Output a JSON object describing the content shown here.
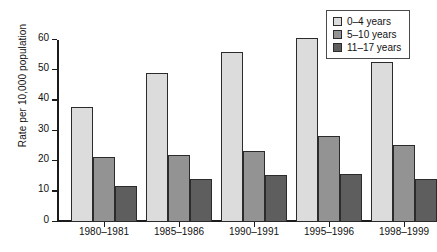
{
  "chart_data": {
    "type": "bar",
    "title": "",
    "xlabel": "",
    "ylabel": "Rate per 10,000 population",
    "categories": [
      "1980–1981",
      "1985–1986",
      "1990–1991",
      "1995–1996",
      "1998–1999"
    ],
    "series": [
      {
        "name": "0–4 years",
        "color": "#dcdcdc",
        "values": [
          37.8,
          49.0,
          56.0,
          60.5,
          52.6
        ]
      },
      {
        "name": "5–10 years",
        "color": "#939393",
        "values": [
          21.3,
          22.1,
          23.5,
          28.3,
          25.3
        ]
      },
      {
        "name": "11–17 years",
        "color": "#5e5e5e",
        "values": [
          12.0,
          14.3,
          15.6,
          15.9,
          14.3
        ]
      }
    ],
    "ylim": [
      0,
      60
    ],
    "yticks": [
      0,
      10,
      20,
      30,
      40,
      50,
      60
    ],
    "ytick_labels": [
      "0",
      "10",
      "20",
      "30",
      "40",
      "50",
      "60"
    ],
    "grid": false,
    "legend_position": "top-right"
  },
  "axes": {
    "y_title": "Rate per 10,000 population"
  }
}
